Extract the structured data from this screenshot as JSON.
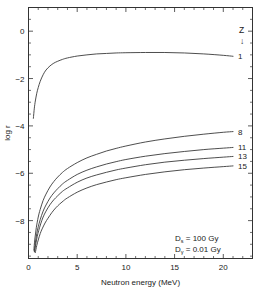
{
  "chart_data": {
    "type": "line",
    "title": "",
    "xlabel": "Neutron energy (MeV)",
    "ylabel": "log r",
    "xlim": [
      0,
      23
    ],
    "ylim": [
      -9.6,
      1.0
    ],
    "grid": false,
    "legend_position": "right-inline",
    "legend_title": "Z",
    "legend_arrow": "↓",
    "xticks": [
      0,
      5,
      10,
      15,
      20
    ],
    "xtick_labels": [
      "0",
      "5",
      "10",
      "15",
      "20"
    ],
    "xminor_step": 1,
    "yticks": [
      0,
      -2,
      -4,
      -6,
      -8
    ],
    "ytick_labels": [
      "0",
      "−2",
      "−4",
      "−6",
      "−8"
    ],
    "yminor_step": 0.5,
    "series": [
      {
        "name": "1",
        "label": "1",
        "x": [
          0.5,
          0.6,
          0.7,
          0.85,
          1.0,
          1.2,
          1.5,
          1.8,
          2.2,
          2.6,
          3.0,
          3.5,
          4.0,
          5.0,
          6.0,
          7.0,
          8.0,
          9.0,
          10.0,
          12.0,
          14.0,
          16.0,
          18.0,
          20.0,
          21.0
        ],
        "y": [
          -3.68,
          -3.25,
          -2.95,
          -2.62,
          -2.38,
          -2.12,
          -1.84,
          -1.64,
          -1.47,
          -1.35,
          -1.27,
          -1.19,
          -1.13,
          -1.05,
          -1.0,
          -0.96,
          -0.94,
          -0.92,
          -0.91,
          -0.9,
          -0.9,
          -0.92,
          -0.96,
          -1.02,
          -1.06
        ]
      },
      {
        "name": "8",
        "label": "8",
        "x": [
          0.55,
          0.65,
          0.8,
          1.0,
          1.2,
          1.5,
          1.8,
          2.2,
          2.6,
          3.0,
          3.5,
          4.0,
          5.0,
          6.0,
          7.0,
          8.0,
          9.0,
          10.0,
          12.0,
          14.0,
          16.0,
          18.0,
          20.0,
          21.0
        ],
        "y": [
          -9.25,
          -8.78,
          -8.3,
          -7.85,
          -7.53,
          -7.15,
          -6.88,
          -6.58,
          -6.35,
          -6.16,
          -5.96,
          -5.8,
          -5.55,
          -5.35,
          -5.2,
          -5.06,
          -4.95,
          -4.85,
          -4.68,
          -4.55,
          -4.44,
          -4.35,
          -4.27,
          -4.24
        ]
      },
      {
        "name": "11",
        "label": "11",
        "x": [
          0.6,
          0.7,
          0.85,
          1.0,
          1.2,
          1.5,
          1.8,
          2.2,
          2.6,
          3.0,
          3.5,
          4.0,
          5.0,
          6.0,
          7.0,
          8.0,
          9.0,
          10.0,
          12.0,
          14.0,
          16.0,
          18.0,
          20.0,
          21.0
        ],
        "y": [
          -9.3,
          -8.95,
          -8.55,
          -8.26,
          -7.96,
          -7.6,
          -7.34,
          -7.05,
          -6.83,
          -6.65,
          -6.45,
          -6.3,
          -6.05,
          -5.87,
          -5.73,
          -5.61,
          -5.51,
          -5.42,
          -5.28,
          -5.17,
          -5.08,
          -5.0,
          -4.94,
          -4.91
        ]
      },
      {
        "name": "13",
        "label": "13",
        "x": [
          0.62,
          0.75,
          0.9,
          1.05,
          1.25,
          1.5,
          1.8,
          2.2,
          2.6,
          3.0,
          3.5,
          4.0,
          5.0,
          6.0,
          7.0,
          8.0,
          9.0,
          10.0,
          12.0,
          14.0,
          16.0,
          18.0,
          20.0,
          21.0
        ],
        "y": [
          -9.32,
          -8.98,
          -8.66,
          -8.42,
          -8.14,
          -7.85,
          -7.6,
          -7.33,
          -7.12,
          -6.95,
          -6.76,
          -6.62,
          -6.38,
          -6.2,
          -6.07,
          -5.96,
          -5.86,
          -5.78,
          -5.64,
          -5.53,
          -5.45,
          -5.38,
          -5.32,
          -5.29
        ]
      },
      {
        "name": "15",
        "label": "15",
        "x": [
          0.7,
          0.85,
          1.0,
          1.2,
          1.4,
          1.7,
          2.0,
          2.4,
          2.8,
          3.2,
          3.6,
          4.0,
          5.0,
          6.0,
          7.0,
          8.0,
          9.0,
          10.0,
          12.0,
          14.0,
          16.0,
          18.0,
          20.0,
          21.0
        ],
        "y": [
          -9.35,
          -9.05,
          -8.82,
          -8.55,
          -8.35,
          -8.1,
          -7.9,
          -7.66,
          -7.46,
          -7.3,
          -7.16,
          -7.04,
          -6.8,
          -6.62,
          -6.48,
          -6.37,
          -6.27,
          -6.19,
          -6.05,
          -5.94,
          -5.85,
          -5.78,
          -5.72,
          -5.69
        ]
      }
    ],
    "annotations": [
      {
        "symbol": "D",
        "subscript": "s",
        "relation": "=",
        "value": "100 Gy"
      },
      {
        "symbol": "D",
        "subscript": "γ",
        "relation": "=",
        "value": "0.01 Gy"
      }
    ]
  }
}
